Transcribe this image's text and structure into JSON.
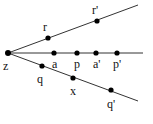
{
  "diagram": {
    "type": "geometric-rays",
    "colors": {
      "line": "#333333",
      "point": "#000000",
      "text": "#111111",
      "background": "#ffffff"
    },
    "origin": {
      "id": "z",
      "label": "z",
      "x": 8,
      "y": 53,
      "label_x": 3,
      "label_y": 70
    },
    "rays": [
      {
        "id": "upper",
        "from": [
          8,
          53
        ],
        "to": [
          138,
          5
        ]
      },
      {
        "id": "middle",
        "from": [
          8,
          53
        ],
        "to": [
          143,
          53
        ]
      },
      {
        "id": "lower",
        "from": [
          8,
          53
        ],
        "to": [
          138,
          101
        ]
      }
    ],
    "points": [
      {
        "id": "r",
        "label": "r",
        "ray": "upper",
        "x": 48,
        "y": 38,
        "label_x": 43,
        "label_y": 31
      },
      {
        "id": "r_prime",
        "label": "r'",
        "ray": "upper",
        "x": 97,
        "y": 21,
        "label_x": 92,
        "label_y": 14
      },
      {
        "id": "a",
        "label": "a",
        "ray": "middle",
        "x": 54,
        "y": 53,
        "label_x": 52,
        "label_y": 68
      },
      {
        "id": "p",
        "label": "p",
        "ray": "middle",
        "x": 77,
        "y": 53,
        "label_x": 74,
        "label_y": 68
      },
      {
        "id": "a_prime",
        "label": "a'",
        "ray": "middle",
        "x": 96,
        "y": 53,
        "label_x": 93,
        "label_y": 68
      },
      {
        "id": "p_prime",
        "label": "p'",
        "ray": "middle",
        "x": 117,
        "y": 53,
        "label_x": 113,
        "label_y": 68
      },
      {
        "id": "q",
        "label": "q",
        "ray": "lower",
        "x": 42,
        "y": 66,
        "label_x": 37,
        "label_y": 83
      },
      {
        "id": "x",
        "label": "x",
        "ray": "lower",
        "x": 73,
        "y": 78,
        "label_x": 70,
        "label_y": 95
      },
      {
        "id": "q_prime",
        "label": "q'",
        "ray": "lower",
        "x": 111,
        "y": 90,
        "label_x": 107,
        "label_y": 108
      }
    ]
  }
}
